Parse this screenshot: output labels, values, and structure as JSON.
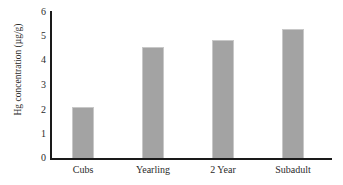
{
  "chart_data": {
    "type": "bar",
    "title": "",
    "xlabel": "",
    "ylabel": "Hg concentration (µg/g)",
    "categories": [
      "Cubs",
      "Yearling",
      "2 Year",
      "Subadult"
    ],
    "values": [
      2.1,
      4.55,
      4.85,
      5.3
    ],
    "ylim": [
      0,
      6
    ],
    "yticks": [
      "0",
      "1",
      "2",
      "3",
      "4",
      "5",
      "6"
    ],
    "ytick_values": [
      0,
      1,
      2,
      3,
      4,
      5,
      6
    ],
    "grid": false,
    "legend": false,
    "bar_color": "#a3a3a3",
    "axis_color": "#1a1a1a",
    "background_color": "#ffffff"
  }
}
